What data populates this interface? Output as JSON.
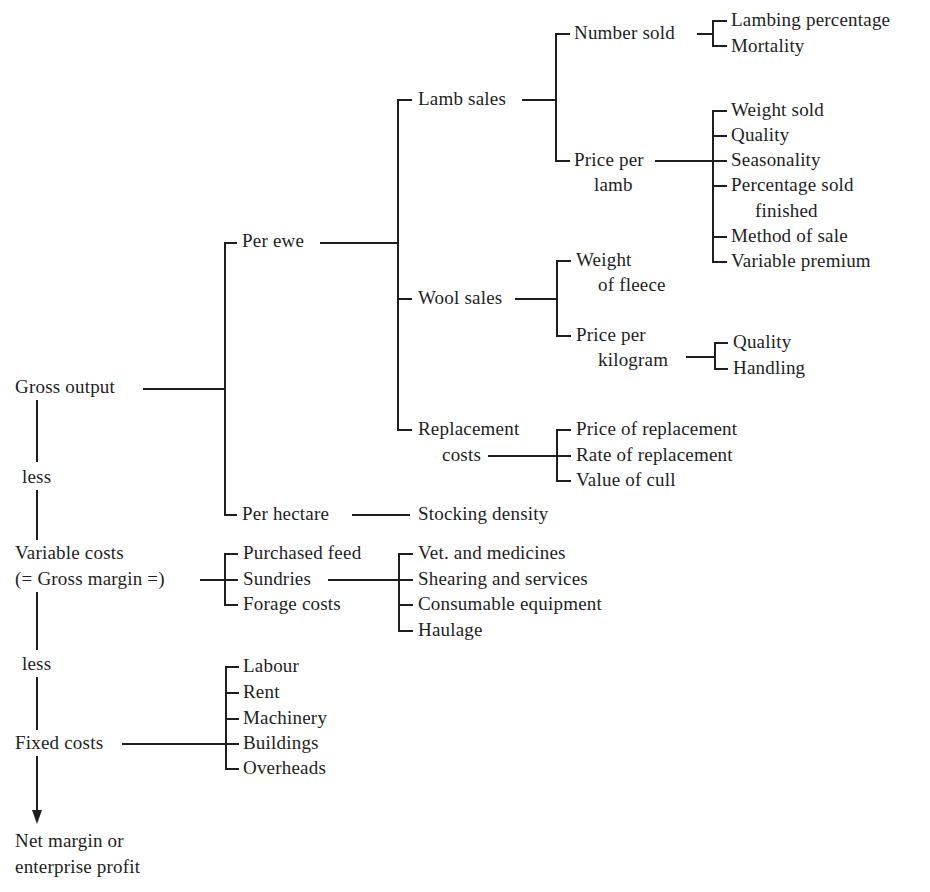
{
  "diagram": {
    "root": {
      "gross_output": "Gross output",
      "less_1": "less",
      "variable_costs": "Variable costs",
      "gross_margin": "(= Gross margin =)",
      "less_2": "less",
      "fixed_costs": "Fixed costs",
      "net_margin_line1": "Net margin or",
      "net_margin_line2": "enterprise profit"
    },
    "gross_output_branch": {
      "per_ewe": "Per ewe",
      "per_hectare": "Per hectare",
      "stocking_density": "Stocking density",
      "lamb_sales": "Lamb sales",
      "number_sold": "Number sold",
      "number_sold_factors": [
        "Lambing percentage",
        "Mortality"
      ],
      "price_per_lamb_line1": "Price per",
      "price_per_lamb_line2": "lamb",
      "price_per_lamb_factors": [
        "Weight sold",
        "Quality",
        "Seasonality",
        "Percentage sold",
        "finished",
        "Method of sale",
        "Variable premium"
      ],
      "wool_sales": "Wool sales",
      "weight_of_fleece_line1": "Weight",
      "weight_of_fleece_line2": "of fleece",
      "price_per_kg_line1": "Price per",
      "price_per_kg_line2": "kilogram",
      "price_per_kg_factors": [
        "Quality",
        "Handling"
      ],
      "replacement_costs_line1": "Replacement",
      "replacement_costs_line2": "costs",
      "replacement_factors": [
        "Price of replacement",
        "Rate of replacement",
        "Value of cull"
      ]
    },
    "variable_costs_branch": {
      "items": [
        "Purchased feed",
        "Sundries",
        "Forage costs"
      ],
      "sundries_items": [
        "Vet. and medicines",
        "Shearing and services",
        "Consumable equipment",
        "Haulage"
      ]
    },
    "fixed_costs_branch": {
      "items": [
        "Labour",
        "Rent",
        "Machinery",
        "Buildings",
        "Overheads"
      ]
    }
  }
}
